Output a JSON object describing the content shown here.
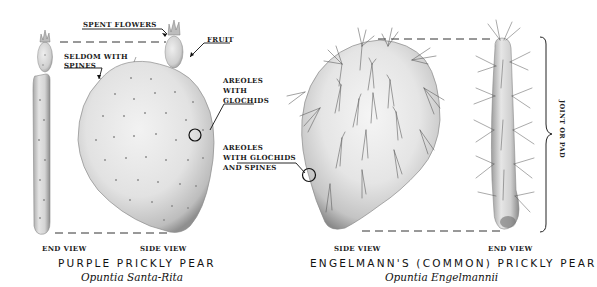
{
  "diagram": {
    "left_specimen": {
      "common_name": "PURPLE PRICKLY PEAR",
      "scientific_name": "Opuntia Santa-Rita",
      "views": {
        "end": "END VIEW",
        "side": "SIDE VIEW"
      },
      "callouts": {
        "spent_flowers": "SPENT FLOWERS",
        "fruit": "FRUIT",
        "seldom_spines_line1": "SELDOM WITH",
        "seldom_spines_line2": "SPINES",
        "areoles_glochids_line1": "AREOLES",
        "areoles_glochids_line2": "WITH",
        "areoles_glochids_line3": "GLOCHIDS"
      }
    },
    "right_specimen": {
      "common_name": "ENGELMANN'S (COMMON) PRICKLY PEAR",
      "scientific_name": "Opuntia Engelmannii",
      "views": {
        "side": "SIDE VIEW",
        "end": "END VIEW"
      },
      "callouts": {
        "areoles_spines_line1": "AREOLES",
        "areoles_spines_line2": "WITH GLOCHIDS",
        "areoles_spines_line3": "AND SPINES",
        "joint_or_pad": "JOINT OR PAD"
      }
    },
    "colors": {
      "background": "#ffffff",
      "pad_light": "#ededed",
      "pad_shadow": "#9a9a9a",
      "ink": "#1a1a1a"
    }
  }
}
